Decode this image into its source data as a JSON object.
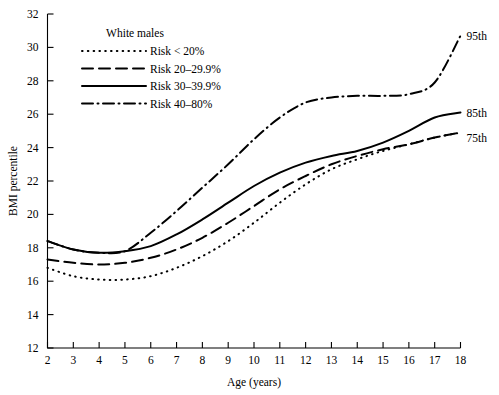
{
  "chart_data": {
    "type": "line",
    "title": "",
    "xlabel": "Age (years)",
    "ylabel": "BMI percentile",
    "xlim": [
      2,
      18
    ],
    "ylim": [
      12,
      32
    ],
    "xticks": [
      2,
      3,
      4,
      5,
      6,
      7,
      8,
      9,
      10,
      11,
      12,
      13,
      14,
      15,
      16,
      17,
      18
    ],
    "yticks": [
      12,
      14,
      16,
      18,
      20,
      22,
      24,
      26,
      28,
      30,
      32
    ],
    "grid": false,
    "legend_position": "top-left-inside",
    "legend_title": "White males",
    "x": [
      2,
      3,
      4,
      5,
      6,
      7,
      8,
      9,
      10,
      11,
      12,
      13,
      14,
      15,
      16,
      17,
      18
    ],
    "series": [
      {
        "name": "Risk < 20%",
        "style": "dotted",
        "end_label": "",
        "values": [
          16.8,
          16.3,
          16.1,
          16.1,
          16.3,
          16.8,
          17.5,
          18.4,
          19.5,
          20.7,
          21.8,
          22.7,
          23.3,
          23.8,
          24.2,
          24.6,
          24.9
        ]
      },
      {
        "name": "Risk 20–29.9%",
        "style": "dashed",
        "end_label": "75th",
        "values": [
          17.3,
          17.1,
          17.0,
          17.1,
          17.4,
          17.9,
          18.6,
          19.5,
          20.5,
          21.5,
          22.3,
          23.0,
          23.5,
          23.9,
          24.2,
          24.6,
          24.9
        ]
      },
      {
        "name": "Risk 30–39.9%",
        "style": "solid",
        "end_label": "85th",
        "values": [
          18.4,
          17.9,
          17.7,
          17.8,
          18.1,
          18.8,
          19.7,
          20.7,
          21.7,
          22.5,
          23.1,
          23.5,
          23.8,
          24.3,
          25.0,
          25.8,
          26.1
        ]
      },
      {
        "name": "Risk 40–80%",
        "style": "dashdot",
        "end_label": "95th",
        "values": [
          18.4,
          17.9,
          17.7,
          17.8,
          18.9,
          20.2,
          21.6,
          23.0,
          24.5,
          25.8,
          26.7,
          27.0,
          27.1,
          27.1,
          27.2,
          27.9,
          30.7
        ]
      }
    ],
    "end_labels": [
      "95th",
      "85th",
      "75th"
    ]
  },
  "legend": {
    "title": "White males",
    "items": [
      {
        "label": "Risk < 20%"
      },
      {
        "label": "Risk 20–29.9%"
      },
      {
        "label": "Risk 30–39.9%"
      },
      {
        "label": "Risk 40–80%"
      }
    ]
  },
  "colors": {
    "ink": "#000000",
    "background": "#ffffff"
  }
}
